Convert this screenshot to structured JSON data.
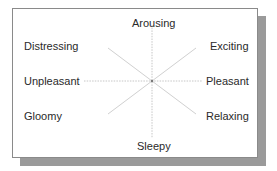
{
  "diagram": {
    "type": "circumplex-mood-map",
    "center": {
      "x": 152,
      "y": 81
    },
    "line_color": "#b8b8b8",
    "labels": {
      "top": "Arousing",
      "top_right": "Exciting",
      "right": "Pleasant",
      "bottom_right": "Relaxing",
      "bottom": "Sleepy",
      "bottom_left": "Gloomy",
      "left": "Unpleasant",
      "top_left": "Distressing"
    }
  }
}
